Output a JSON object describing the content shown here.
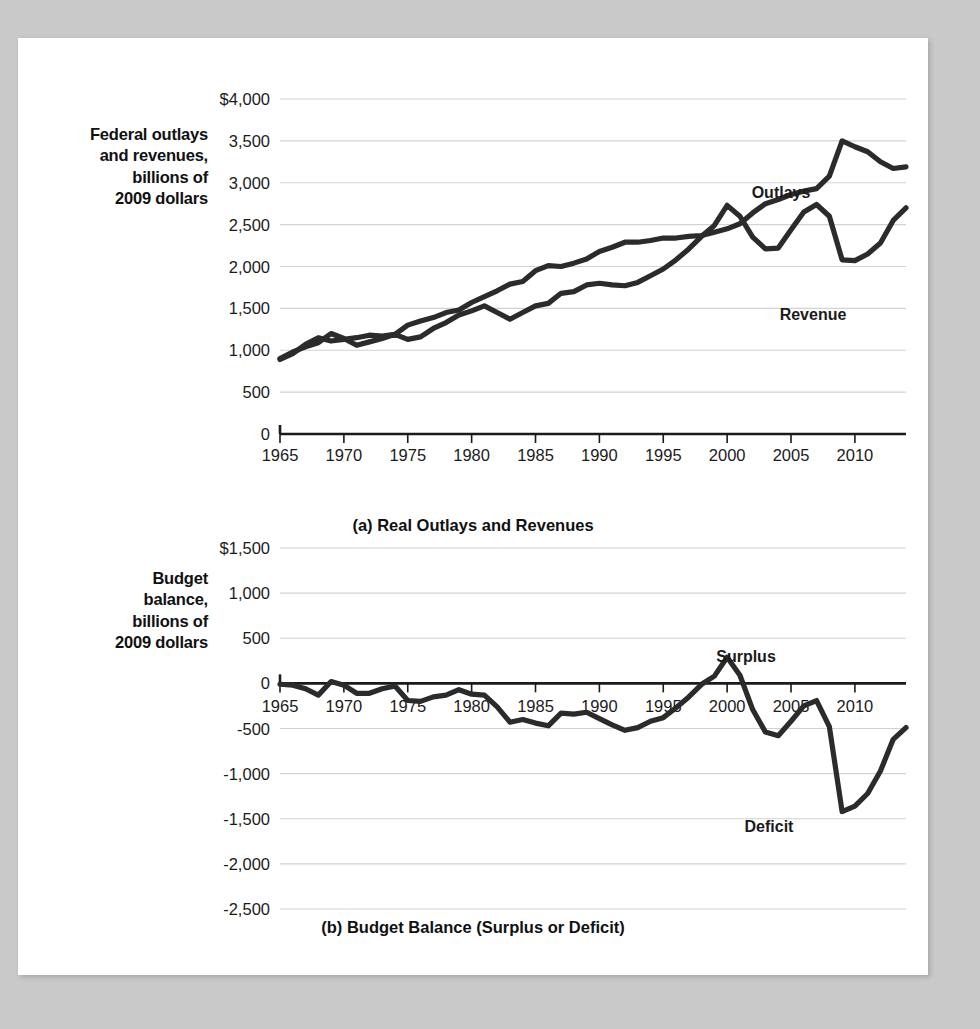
{
  "figure": {
    "background_color": "#c9c9c9",
    "page_color": "#ffffff",
    "line_color": "#2b2b2b",
    "grid_color": "#d2d2d2"
  },
  "panel_a": {
    "caption": "(a) Real Outlays and Revenues",
    "axis_title_lines": [
      "Federal outlays",
      "and revenues,",
      "billions of",
      "2009 dollars"
    ],
    "series_label_outlays": "Outlays",
    "series_label_revenue": "Revenue"
  },
  "panel_b": {
    "caption": "(b) Budget Balance (Surplus or Deficit)",
    "axis_title_lines": [
      "Budget",
      "balance,",
      "billions of",
      "2009 dollars"
    ],
    "series_label_surplus": "Surplus",
    "series_label_deficit": "Deficit"
  },
  "chart_data": [
    {
      "type": "line",
      "title": "(a) Real Outlays and Revenues",
      "xlabel": "",
      "ylabel": "Federal outlays and revenues, billions of 2009 dollars",
      "xlim": [
        1965,
        2014
      ],
      "ylim": [
        0,
        4000
      ],
      "ytick_values": [
        0,
        500,
        1000,
        1500,
        2000,
        2500,
        3000,
        3500,
        4000
      ],
      "ytick_labels": [
        "0",
        "500",
        "1,000",
        "1,500",
        "2,000",
        "2,500",
        "3,000",
        "3,500",
        "$4,000"
      ],
      "xtick_values": [
        1965,
        1970,
        1975,
        1980,
        1985,
        1990,
        1995,
        2000,
        2005,
        2010
      ],
      "xtick_labels": [
        "1965",
        "1970",
        "1975",
        "1980",
        "1985",
        "1990",
        "1995",
        "2000",
        "2005",
        "2010"
      ],
      "grid": "horizontal",
      "legend": "inline-annotations",
      "x": [
        1965,
        1966,
        1967,
        1968,
        1969,
        1970,
        1971,
        1972,
        1973,
        1974,
        1975,
        1976,
        1977,
        1978,
        1979,
        1980,
        1981,
        1982,
        1983,
        1984,
        1985,
        1986,
        1987,
        1988,
        1989,
        1990,
        1991,
        1992,
        1993,
        1994,
        1995,
        1996,
        1997,
        1998,
        1999,
        2000,
        2001,
        2002,
        2003,
        2004,
        2005,
        2006,
        2007,
        2008,
        2009,
        2010,
        2011,
        2012,
        2013,
        2014
      ],
      "series": [
        {
          "name": "Outlays",
          "values": [
            890,
            960,
            1070,
            1150,
            1110,
            1130,
            1150,
            1180,
            1170,
            1190,
            1300,
            1350,
            1390,
            1450,
            1480,
            1570,
            1640,
            1710,
            1790,
            1820,
            1950,
            2010,
            2000,
            2040,
            2090,
            2180,
            2230,
            2290,
            2290,
            2310,
            2340,
            2340,
            2360,
            2370,
            2410,
            2450,
            2510,
            2640,
            2750,
            2800,
            2860,
            2900,
            2930,
            3080,
            3500,
            3430,
            3370,
            3250,
            3170,
            3190
          ]
        },
        {
          "name": "Revenue",
          "values": [
            900,
            980,
            1040,
            1090,
            1200,
            1140,
            1060,
            1100,
            1140,
            1190,
            1130,
            1160,
            1260,
            1330,
            1420,
            1470,
            1530,
            1450,
            1370,
            1450,
            1530,
            1560,
            1680,
            1700,
            1780,
            1800,
            1780,
            1770,
            1810,
            1890,
            1970,
            2080,
            2210,
            2360,
            2490,
            2730,
            2600,
            2350,
            2210,
            2220,
            2440,
            2650,
            2740,
            2600,
            2080,
            2070,
            2150,
            2280,
            2550,
            2700
          ]
        }
      ]
    },
    {
      "type": "line",
      "title": "(b) Budget Balance (Surplus or Deficit)",
      "xlabel": "",
      "ylabel": "Budget balance, billions of 2009 dollars",
      "xlim": [
        1965,
        2014
      ],
      "ylim": [
        -2500,
        1500
      ],
      "ytick_values": [
        1500,
        1000,
        500,
        0,
        -500,
        -1000,
        -1500,
        -2000,
        -2500
      ],
      "ytick_labels": [
        "$1,500",
        "1,000",
        "500",
        "0",
        "-500",
        "-1,000",
        "-1,500",
        "-2,000",
        "-2,500"
      ],
      "xtick_values": [
        1965,
        1970,
        1975,
        1980,
        1985,
        1990,
        1995,
        2000,
        2005,
        2010
      ],
      "xtick_labels": [
        "1965",
        "1970",
        "1975",
        "1980",
        "1985",
        "1990",
        "1995",
        "2000",
        "2005",
        "2010"
      ],
      "grid": "horizontal",
      "legend": "inline-annotations",
      "x": [
        1965,
        1966,
        1967,
        1968,
        1969,
        1970,
        1971,
        1972,
        1973,
        1974,
        1975,
        1976,
        1977,
        1978,
        1979,
        1980,
        1981,
        1982,
        1983,
        1984,
        1985,
        1986,
        1987,
        1988,
        1989,
        1990,
        1991,
        1992,
        1993,
        1994,
        1995,
        1996,
        1997,
        1998,
        1999,
        2000,
        2001,
        2002,
        2003,
        2004,
        2005,
        2006,
        2007,
        2008,
        2009,
        2010,
        2011,
        2012,
        2013,
        2014
      ],
      "series": [
        {
          "name": "Budget balance",
          "values": [
            -10,
            -20,
            -60,
            -130,
            20,
            -20,
            -110,
            -110,
            -60,
            -30,
            -190,
            -200,
            -150,
            -130,
            -70,
            -120,
            -130,
            -260,
            -430,
            -400,
            -440,
            -470,
            -330,
            -340,
            -320,
            -390,
            -460,
            -520,
            -490,
            -420,
            -380,
            -270,
            -150,
            -10,
            80,
            290,
            90,
            -290,
            -540,
            -580,
            -420,
            -250,
            -190,
            -480,
            -1420,
            -1360,
            -1220,
            -970,
            -620,
            -490
          ]
        }
      ]
    }
  ]
}
